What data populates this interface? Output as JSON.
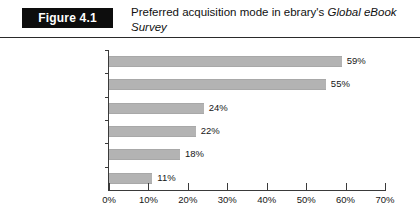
{
  "figure": {
    "badge_label": "Figure 4.1",
    "title_lead": "Preferred acquisition mode in ebrary's ",
    "title_italic": "Global eBook Survey"
  },
  "chart_data": {
    "type": "bar",
    "orientation": "horizontal",
    "title": "Preferred acquisition mode in ebrary's Global eBook Survey",
    "xlabel": "",
    "ylabel": "",
    "categories": [
      "Purchase",
      "Subscription",
      "Patron driven",
      "Pay-per-use",
      "Lease-to-own",
      "Other (please explain)"
    ],
    "values": [
      59,
      55,
      24,
      22,
      18,
      11
    ],
    "value_labels": [
      "59%",
      "55%",
      "24%",
      "22%",
      "18%",
      "11%"
    ],
    "xlim": [
      0,
      70
    ],
    "x_ticks": [
      0,
      10,
      20,
      30,
      40,
      50,
      60,
      70
    ],
    "x_tick_labels": [
      "0%",
      "10%",
      "20%",
      "30%",
      "40%",
      "50%",
      "60%",
      "70%"
    ],
    "grid": false,
    "legend": false,
    "bar_color": "#b3b3b3",
    "axis_color": "#3a3a3a",
    "background": "#ffffff"
  }
}
